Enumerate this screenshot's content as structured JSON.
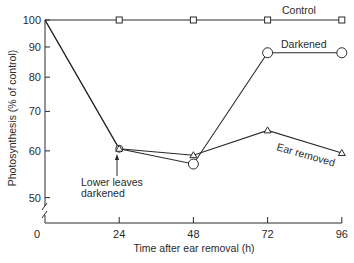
{
  "chart_data": {
    "type": "line",
    "title": "",
    "xlabel": "Time after ear removal (h)",
    "ylabel": "Photosynthesis (% of control)",
    "y_scale": "log",
    "ylim": [
      45,
      100
    ],
    "xlim": [
      0,
      96
    ],
    "grid": false,
    "legend": "inline labels next to lines",
    "x_ticks": [
      "0",
      "24",
      "48",
      "72",
      "96"
    ],
    "y_ticks": [
      "100",
      "90",
      "80",
      "70",
      "60",
      "50"
    ],
    "x": [
      0,
      24,
      48,
      72,
      96
    ],
    "series": [
      {
        "name": "Control",
        "marker": "square",
        "values": [
          100,
          100,
          100,
          100,
          100
        ]
      },
      {
        "name": "Darkened",
        "marker": "circle",
        "values": [
          100,
          60.5,
          57,
          88,
          88
        ]
      },
      {
        "name": "Ear removed",
        "marker": "triangle",
        "values": [
          100,
          60.5,
          59,
          65,
          59.5
        ]
      }
    ],
    "annotations": [
      {
        "text": "Lower leaves darkened",
        "x": 24,
        "arrow_to": 60.5
      }
    ],
    "axis_break": "y-axis broken below 50"
  },
  "labels": {
    "xlabel": "Time after ear removal (h)",
    "ylabel": "Photosynthesis (% of control)",
    "control": "Control",
    "darkened": "Darkened",
    "ear_removed": "Ear removed",
    "annot_line1": "Lower leaves",
    "annot_line2": "darkened"
  },
  "colors": {
    "ink": "#2a2a2a",
    "background": "#ffffff"
  }
}
